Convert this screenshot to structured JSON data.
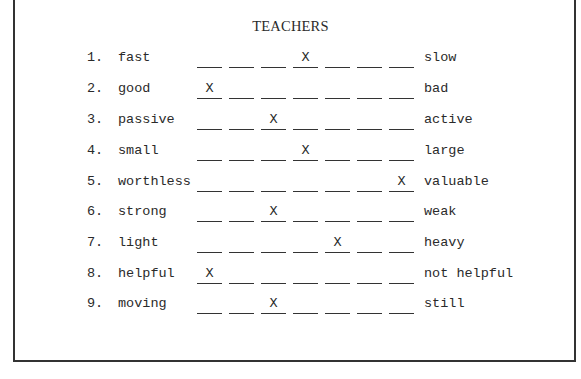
{
  "document": {
    "title": "TEACHERS",
    "scale_points": 7,
    "mark_symbol": "X",
    "items": [
      {
        "number": "1.",
        "left": "fast",
        "right": "slow",
        "mark_position": 4,
        "marks": [
          "",
          "",
          "",
          "X",
          "",
          "",
          ""
        ]
      },
      {
        "number": "2.",
        "left": "good",
        "right": "bad",
        "mark_position": 1,
        "marks": [
          "X",
          "",
          "",
          "",
          "",
          "",
          ""
        ]
      },
      {
        "number": "3.",
        "left": "passive",
        "right": "active",
        "mark_position": 3,
        "marks": [
          "",
          "",
          "X",
          "",
          "",
          "",
          ""
        ]
      },
      {
        "number": "4.",
        "left": "small",
        "right": "large",
        "mark_position": 4,
        "marks": [
          "",
          "",
          "",
          "X",
          "",
          "",
          ""
        ]
      },
      {
        "number": "5.",
        "left": "worthless",
        "right": "valuable",
        "mark_position": 7,
        "marks": [
          "",
          "",
          "",
          "",
          "",
          "",
          "X"
        ]
      },
      {
        "number": "6.",
        "left": "strong",
        "right": "weak",
        "mark_position": 3,
        "marks": [
          "",
          "",
          "X",
          "",
          "",
          "",
          ""
        ]
      },
      {
        "number": "7.",
        "left": "light",
        "right": "heavy",
        "mark_position": 5,
        "marks": [
          "",
          "",
          "",
          "",
          "X",
          "",
          ""
        ]
      },
      {
        "number": "8.",
        "left": "helpful",
        "right": "not helpful",
        "mark_position": 1,
        "marks": [
          "X",
          "",
          "",
          "",
          "",
          "",
          ""
        ]
      },
      {
        "number": "9.",
        "left": "moving",
        "right": "still",
        "mark_position": 3,
        "marks": [
          "",
          "",
          "X",
          "",
          "",
          "",
          ""
        ]
      }
    ]
  },
  "layout": {
    "row_tops": [
      49,
      80,
      111,
      142,
      173,
      203,
      234,
      265,
      295
    ],
    "blank_lefts": [
      0,
      32,
      64,
      96,
      128,
      160,
      192
    ]
  },
  "colors": {
    "ink": "#2a2a2a",
    "rule": "#333333",
    "paper": "#ffffff"
  }
}
